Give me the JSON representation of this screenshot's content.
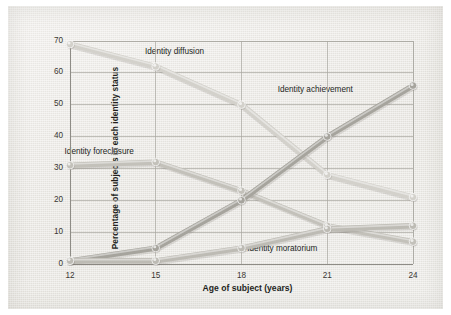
{
  "chart_data": {
    "type": "line",
    "title": "",
    "xlabel": "Age of subject (years)",
    "ylabel": "Percentage of subjects in each identity status",
    "x": [
      12,
      15,
      18,
      21,
      24
    ],
    "xtick_labels": [
      "12",
      "15",
      "18",
      "21",
      "24"
    ],
    "ytick_labels": [
      "0",
      "10",
      "20",
      "30",
      "40",
      "50",
      "60",
      "70"
    ],
    "xlim": [
      12,
      24
    ],
    "ylim": [
      0,
      70
    ],
    "grid": true,
    "legend_position": "inline-annotations",
    "series": [
      {
        "name": "Identity diffusion",
        "values": [
          69,
          62,
          50,
          28,
          21
        ],
        "color": "#d3d1cb",
        "label_x_pct": 31.5,
        "label_y_pct": 13.5
      },
      {
        "name": "Identity foreclosure",
        "values": [
          31,
          32,
          23,
          12,
          7
        ],
        "color": "#c3c1ba",
        "label_x_pct": 13.0,
        "label_y_pct": 46.5
      },
      {
        "name": "Identity achievement",
        "values": [
          1,
          5,
          20,
          40,
          56
        ],
        "color": "#a6a49d",
        "label_x_pct": 62.0,
        "label_y_pct": 26.0
      },
      {
        "name": "Identity moratorium",
        "values": [
          1,
          1,
          5,
          11,
          12
        ],
        "color": "#bdbbb4",
        "label_x_pct": 55.0,
        "label_y_pct": 78.5
      }
    ]
  }
}
